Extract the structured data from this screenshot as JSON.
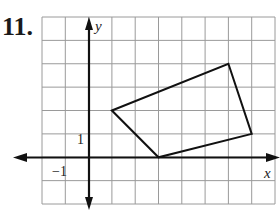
{
  "header": {
    "partial_text": "ch • Ans"
  },
  "problem": {
    "number": "11."
  },
  "graph": {
    "x_axis_label": "x",
    "y_axis_label": "y",
    "tick_labels": {
      "x_neg_one": "−1",
      "y_one": "1"
    },
    "grid": {
      "x_min": -2,
      "x_max": 8,
      "y_min": -2,
      "y_max": 6
    },
    "polygon": {
      "vertices": [
        [
          1,
          2
        ],
        [
          6,
          4
        ],
        [
          7,
          1
        ],
        [
          3,
          0
        ]
      ]
    },
    "colors": {
      "grid": "#9a9a9a",
      "axes": "#111111",
      "polygon": "#111111"
    }
  },
  "chart_data": {
    "type": "scatter",
    "title": "11.",
    "xlabel": "x",
    "ylabel": "y",
    "xlim": [
      -2,
      8
    ],
    "ylim": [
      -2,
      6
    ],
    "grid": true,
    "series": [
      {
        "name": "quadrilateral",
        "closed": true,
        "x": [
          1,
          6,
          7,
          3
        ],
        "y": [
          2,
          4,
          1,
          0
        ]
      }
    ],
    "annotations": [
      "1",
      "−1"
    ]
  }
}
